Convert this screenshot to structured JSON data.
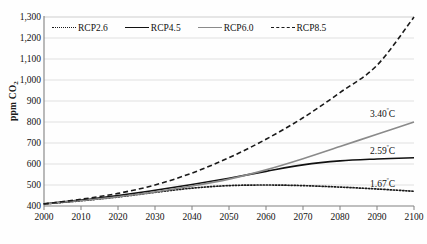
{
  "chart_data": {
    "type": "line",
    "title": "",
    "xlabel": "",
    "ylabel": "ppm CO2",
    "ylabel_prefix": "ppm CO",
    "ylabel_sub": "2",
    "xlim": [
      2000,
      2100
    ],
    "ylim": [
      400,
      1300
    ],
    "grid": true,
    "legend_position": "top-left-inside",
    "x": [
      2000,
      2010,
      2020,
      2030,
      2040,
      2050,
      2060,
      2070,
      2080,
      2090,
      2100
    ],
    "xticklabels": [
      "2000",
      "2010",
      "2020",
      "2030",
      "2040",
      "2050",
      "2060",
      "2070",
      "2080",
      "2090",
      "2100"
    ],
    "yticks": [
      400,
      500,
      600,
      700,
      800,
      900,
      1000,
      1100,
      1200,
      1300
    ],
    "yticklabels": [
      "400",
      "500",
      "600",
      "700",
      "800",
      "900",
      "1,000",
      "1,100",
      "1,200",
      "1,300"
    ],
    "series": [
      {
        "name": "RCP2.6",
        "style": "dotted",
        "color": "#1a1a1a",
        "values": [
          410,
          425,
          443,
          465,
          485,
          497,
          500,
          497,
          490,
          481,
          470
        ],
        "end_annotation": "1.67",
        "end_annotation_unit": "º",
        "end_annotation_suffix": "C"
      },
      {
        "name": "RCP4.5",
        "style": "solid",
        "color": "#111111",
        "values": [
          410,
          428,
          450,
          475,
          502,
          532,
          565,
          596,
          615,
          624,
          630
        ],
        "end_annotation": "2.59",
        "end_annotation_unit": "º",
        "end_annotation_suffix": "C"
      },
      {
        "name": "RCP6.0",
        "style": "solid",
        "color": "#8a8a8a",
        "values": [
          410,
          426,
          444,
          467,
          495,
          528,
          572,
          625,
          683,
          742,
          800
        ],
        "end_annotation": "3.40",
        "end_annotation_unit": "º",
        "end_annotation_suffix": "C"
      },
      {
        "name": "RCP8.5",
        "style": "dashed",
        "color": "#1a1a1a",
        "values": [
          410,
          432,
          460,
          500,
          557,
          630,
          718,
          820,
          940,
          1070,
          1300
        ],
        "end_annotation": "4.43",
        "end_annotation_unit": "º",
        "end_annotation_suffix": "C"
      }
    ]
  },
  "legend": {
    "items": [
      {
        "label": "RCP2.6",
        "style": "dotted"
      },
      {
        "label": "RCP4.5",
        "style": "solid"
      },
      {
        "label": "RCP6.0",
        "style": "solid-gray"
      },
      {
        "label": "RCP8.5",
        "style": "dashed"
      }
    ]
  },
  "annotations": [
    {
      "text": "4.43",
      "unit": "º",
      "suffix": "C",
      "series": "RCP8.5"
    },
    {
      "text": "3.40",
      "unit": "º",
      "suffix": "C",
      "series": "RCP6.0"
    },
    {
      "text": "2.59",
      "unit": "º",
      "suffix": "C",
      "series": "RCP4.5"
    },
    {
      "text": "1.67",
      "unit": "º",
      "suffix": "C",
      "series": "RCP2.6"
    }
  ],
  "colors": {
    "gridline": "#d9d9d9",
    "axis": "#808080",
    "dark_line": "#1a1a1a",
    "gray_line": "#8a8a8a",
    "background": "#ffffff"
  }
}
